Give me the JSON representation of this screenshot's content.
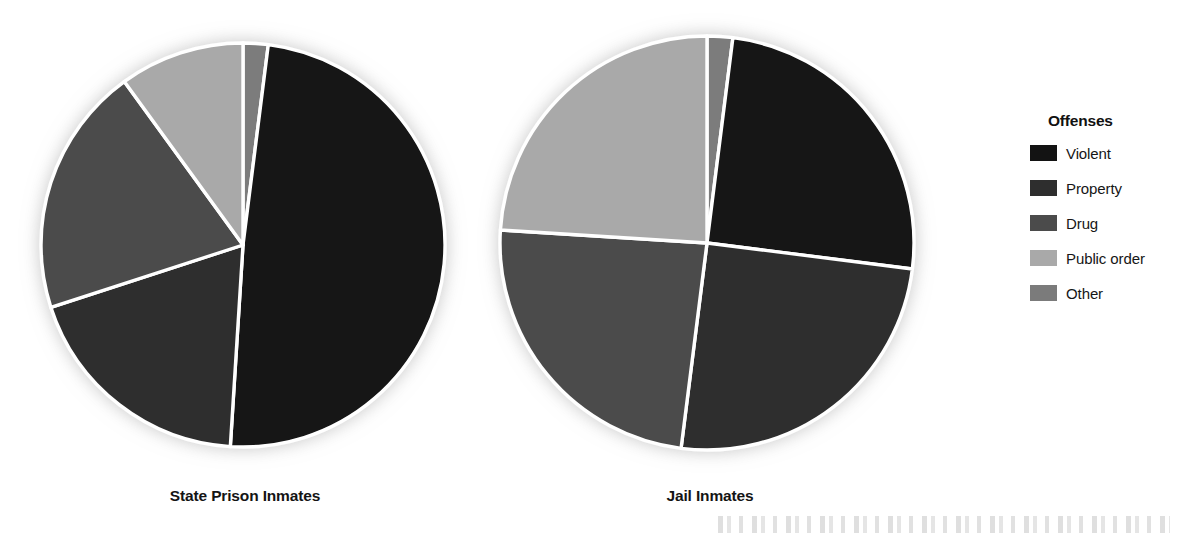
{
  "figure": {
    "legend": {
      "title": "Offenses",
      "entries": [
        {
          "label": "Violent",
          "color": "#131313"
        },
        {
          "label": "Property",
          "color": "#2e2e2e"
        },
        {
          "label": "Drug",
          "color": "#4b4b4b"
        },
        {
          "label": "Public order",
          "color": "#a9a9a9"
        },
        {
          "label": "Other",
          "color": "#7b7b7b"
        }
      ]
    },
    "pies": [
      {
        "caption": "State Prison Inmates"
      },
      {
        "caption": "Jail Inmates"
      }
    ]
  },
  "chart_data": [
    {
      "type": "pie",
      "title": "State Prison Inmates",
      "categories": [
        "Other",
        "Violent",
        "Property",
        "Drug",
        "Public order"
      ],
      "values": [
        2,
        49,
        19,
        20,
        10
      ],
      "unit": "percent",
      "start_angle_deg": 0,
      "direction": "clockwise",
      "colors": [
        "#7b7b7b",
        "#131313",
        "#2e2e2e",
        "#4b4b4b",
        "#a9a9a9"
      ],
      "legend_position": "right",
      "grid": false
    },
    {
      "type": "pie",
      "title": "Jail Inmates",
      "categories": [
        "Other",
        "Violent",
        "Property",
        "Drug",
        "Public order"
      ],
      "values": [
        2,
        25,
        25,
        24,
        24
      ],
      "unit": "percent",
      "start_angle_deg": 0,
      "direction": "clockwise",
      "colors": [
        "#7b7b7b",
        "#131313",
        "#2e2e2e",
        "#4b4b4b",
        "#a9a9a9"
      ],
      "legend_position": "right",
      "grid": false
    }
  ]
}
